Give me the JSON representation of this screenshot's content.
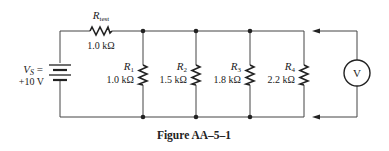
{
  "figure": {
    "caption": "Figure AA–5–1"
  },
  "source": {
    "symbol": "V",
    "subscript": "S",
    "eq": " =",
    "value": "+10 V"
  },
  "resistors": [
    {
      "name": "R",
      "sub": "test",
      "value": "1.0 kΩ"
    },
    {
      "name": "R",
      "sub": "1",
      "value": "1.0 kΩ"
    },
    {
      "name": "R",
      "sub": "2",
      "value": "1.5 kΩ"
    },
    {
      "name": "R",
      "sub": "3",
      "value": "1.8 kΩ"
    },
    {
      "name": "R",
      "sub": "4",
      "value": "2.2 kΩ"
    }
  ],
  "meter": {
    "label": "V"
  }
}
